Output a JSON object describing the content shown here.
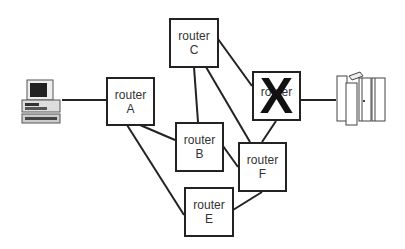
{
  "diagram": {
    "routers": [
      {
        "id": "A",
        "label": "router",
        "letter": "A",
        "failed": false
      },
      {
        "id": "B",
        "label": "router",
        "letter": "B",
        "failed": false
      },
      {
        "id": "C",
        "label": "router",
        "letter": "C",
        "failed": false
      },
      {
        "id": "D",
        "label": "router",
        "letter": "",
        "failed": true,
        "failed_mark": "X"
      },
      {
        "id": "E",
        "label": "router",
        "letter": "E",
        "failed": false
      },
      {
        "id": "F",
        "label": "router",
        "letter": "F",
        "failed": false
      }
    ],
    "endpoints": [
      {
        "id": "client",
        "icon": "desktop-computer-icon"
      },
      {
        "id": "server",
        "icon": "server-rack-icon"
      }
    ],
    "links": [
      [
        "client",
        "A"
      ],
      [
        "A",
        "B"
      ],
      [
        "A",
        "E"
      ],
      [
        "C",
        "B"
      ],
      [
        "C",
        "F"
      ],
      [
        "C",
        "D"
      ],
      [
        "D",
        "F"
      ],
      [
        "D",
        "server"
      ],
      [
        "B",
        "F"
      ],
      [
        "F",
        "E"
      ]
    ]
  }
}
